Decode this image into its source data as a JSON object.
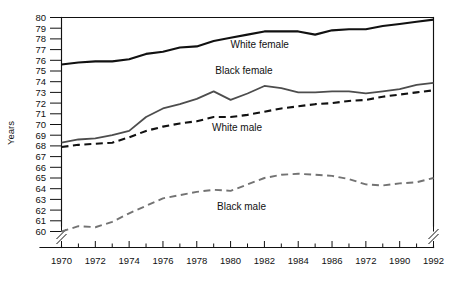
{
  "chart_data": {
    "type": "line",
    "title": "",
    "xlabel": "",
    "ylabel": "Years",
    "xlim": [
      1970,
      1992
    ],
    "ylim": [
      60,
      80
    ],
    "grid": false,
    "axis_break_y": true,
    "axis_break_x_right": true,
    "legend_position": "inline-annotations",
    "ytick_labels": [
      "60",
      "61",
      "62",
      "63",
      "64",
      "65",
      "66",
      "67",
      "68",
      "69",
      "70",
      "71",
      "72",
      "73",
      "74",
      "75",
      "76",
      "77",
      "78",
      "79",
      "80"
    ],
    "xtick_labels": [
      "1970",
      "1972",
      "1974",
      "1976",
      "1978",
      "1980",
      "1982",
      "1984",
      "1986",
      "1972",
      "1990",
      "1992"
    ],
    "xtick_values": [
      1970,
      1972,
      1974,
      1976,
      1978,
      1980,
      1982,
      1984,
      1986,
      1988,
      1990,
      1992
    ],
    "x": [
      1970,
      1971,
      1972,
      1973,
      1974,
      1975,
      1976,
      1977,
      1978,
      1979,
      1980,
      1981,
      1982,
      1983,
      1984,
      1985,
      1986,
      1987,
      1988,
      1989,
      1990,
      1991,
      1992
    ],
    "series": [
      {
        "name": "White female",
        "label": "White female",
        "color": "#111111",
        "style": "solid",
        "width": 2.1,
        "label_x": 1980.0,
        "label_y": 77.15,
        "values": [
          75.6,
          75.8,
          75.9,
          75.9,
          76.1,
          76.6,
          76.8,
          77.2,
          77.3,
          77.8,
          78.1,
          78.4,
          78.7,
          78.7,
          78.7,
          78.4,
          78.8,
          78.9,
          78.9,
          79.2,
          79.4,
          79.6,
          79.8
        ]
      },
      {
        "name": "Black female",
        "label": "Black female",
        "color": "#4d4d4d",
        "style": "solid",
        "width": 1.8,
        "label_x": 1979.1,
        "label_y": 74.75,
        "values": [
          68.3,
          68.6,
          68.7,
          69.0,
          69.4,
          70.7,
          71.5,
          71.9,
          72.4,
          73.1,
          72.3,
          72.9,
          73.6,
          73.4,
          73.0,
          73.0,
          73.1,
          73.1,
          72.9,
          73.1,
          73.3,
          73.7,
          73.9
        ]
      },
      {
        "name": "White male",
        "label": "White male",
        "color": "#111111",
        "style": "dashed",
        "width": 2.1,
        "dash": "7,4.5",
        "label_x": 1978.9,
        "label_y": 69.35,
        "values": [
          67.9,
          68.1,
          68.2,
          68.3,
          68.8,
          69.4,
          69.8,
          70.1,
          70.3,
          70.7,
          70.7,
          70.9,
          71.2,
          71.5,
          71.7,
          71.9,
          72.0,
          72.2,
          72.3,
          72.6,
          72.8,
          73.0,
          73.2
        ]
      },
      {
        "name": "Black male",
        "label": "Black male",
        "color": "#737373",
        "style": "dashed",
        "width": 1.9,
        "dash": "7,4.5",
        "label_x": 1979.2,
        "label_y": 62.0,
        "values": [
          60.0,
          60.5,
          60.4,
          60.9,
          61.7,
          62.4,
          63.1,
          63.4,
          63.7,
          63.9,
          63.8,
          64.4,
          65.0,
          65.3,
          65.4,
          65.3,
          65.2,
          64.9,
          64.4,
          64.3,
          64.5,
          64.6,
          65.0
        ]
      }
    ]
  }
}
